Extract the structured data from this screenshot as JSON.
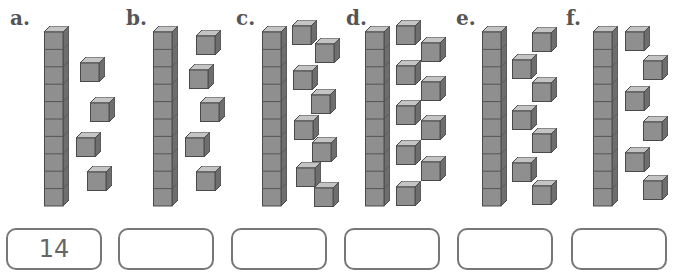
{
  "problems": [
    {
      "label": "a.",
      "tens": 1,
      "ones": 4,
      "answer": "14"
    },
    {
      "label": "b.",
      "tens": 1,
      "ones": 5,
      "answer": ""
    },
    {
      "label": "c.",
      "tens": 1,
      "ones": 8,
      "answer": ""
    },
    {
      "label": "d.",
      "tens": 1,
      "ones": 9,
      "answer": ""
    },
    {
      "label": "e.",
      "tens": 1,
      "ones": 7,
      "answer": ""
    },
    {
      "label": "f.",
      "tens": 1,
      "ones": 6,
      "answer": ""
    }
  ],
  "colors": {
    "cube_front": "#8f8f8f",
    "cube_top": "#c4c4c4",
    "cube_side": "#6e6e6e",
    "outline": "#4a4a4a",
    "box_border": "#777777"
  }
}
